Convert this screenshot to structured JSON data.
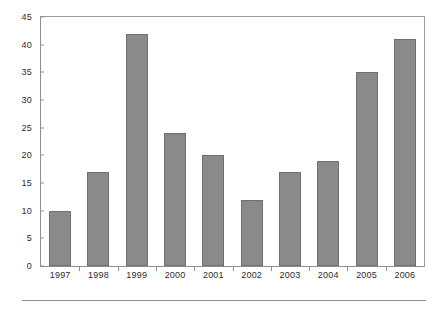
{
  "chart_data": {
    "type": "bar",
    "title": "",
    "subtitle": "",
    "xlabel": "",
    "ylabel": "",
    "categories": [
      "1997",
      "1998",
      "1999",
      "2000",
      "2001",
      "2002",
      "2003",
      "2004",
      "2005",
      "2006"
    ],
    "values": [
      10,
      17,
      42,
      24,
      20,
      12,
      17,
      19,
      35,
      41
    ],
    "series": [
      {
        "name": "",
        "values": [
          10,
          17,
          42,
          24,
          20,
          12,
          17,
          19,
          35,
          41
        ]
      }
    ],
    "ylim": [
      0,
      45
    ],
    "ytick_step": 5,
    "yticks": [
      "0",
      "5",
      "10",
      "15",
      "20",
      "25",
      "30",
      "35",
      "40",
      "45"
    ],
    "ytick_values": [
      0,
      5,
      10,
      15,
      20,
      25,
      30,
      35,
      40,
      45
    ],
    "grid": false,
    "legend": false,
    "legend_position": "none",
    "annotations": [],
    "colors": {
      "bar_fill": "#8a8a8a",
      "bar_edge": "#6f6f6f",
      "axis": "#8f8f8f",
      "text": "#2b2b2b",
      "background": "#ffffff"
    }
  }
}
